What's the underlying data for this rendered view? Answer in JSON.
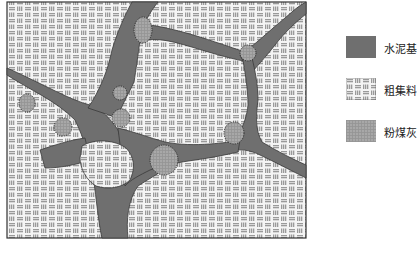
{
  "diagram": {
    "type": "concrete-microstructure-schematic",
    "regions": [
      {
        "id": "cement",
        "label": "水泥基",
        "fill": "#6e6e6e",
        "pattern": "solid"
      },
      {
        "id": "aggregate",
        "label": "粗集料",
        "fill": "#e8e8e8",
        "pattern": "brick-hatch"
      },
      {
        "id": "flyash",
        "label": "粉煤灰",
        "fill": "#9a9a9a",
        "pattern": "fine-grid"
      }
    ]
  },
  "legend": {
    "items": [
      {
        "label": "水泥基",
        "swatch": "cement"
      },
      {
        "label": "粗集料",
        "swatch": "aggregate"
      },
      {
        "label": "粉煤灰",
        "swatch": "flyash"
      }
    ]
  },
  "colors": {
    "cement": "#6e6e6e",
    "aggregate_bg": "#f2f2f2",
    "aggregate_mark": "#9c9c9c",
    "flyash": "#a2a2a2",
    "frame": "#333333"
  }
}
